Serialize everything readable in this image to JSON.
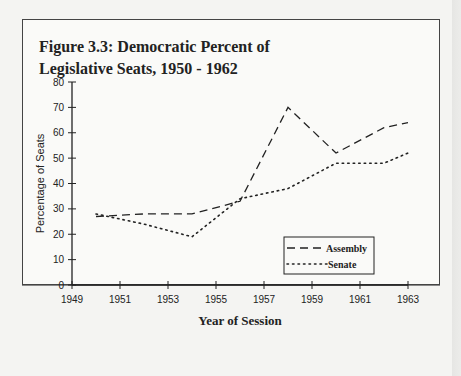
{
  "figure": {
    "title_line1": "Figure 3.3: Democratic Percent of",
    "title_line2": "Legislative Seats, 1950 - 1962"
  },
  "chart_data": {
    "type": "line",
    "title": "Figure 3.3: Democratic Percent of Legislative Seats, 1950 - 1962",
    "xlabel": "Year of Session",
    "ylabel": "Percentage of Seats",
    "xlim": [
      1949,
      1963
    ],
    "ylim": [
      0,
      80
    ],
    "x_ticks": [
      1949,
      1951,
      1953,
      1955,
      1957,
      1959,
      1961,
      1963
    ],
    "y_ticks": [
      0,
      10,
      20,
      30,
      40,
      50,
      60,
      70,
      80
    ],
    "grid": false,
    "legend_position": "lower right, inside plot",
    "series": [
      {
        "name": "Assembly",
        "style": "dashed",
        "x": [
          1950,
          1952,
          1954,
          1956,
          1958,
          1960,
          1962,
          1963
        ],
        "values": [
          27,
          28,
          28,
          33,
          70,
          52,
          62,
          64
        ]
      },
      {
        "name": "Senate",
        "style": "dotted",
        "x": [
          1950,
          1952,
          1954,
          1956,
          1958,
          1960,
          1962,
          1963
        ],
        "values": [
          28,
          24,
          19,
          34,
          38,
          48,
          48,
          52
        ]
      }
    ]
  },
  "legend": {
    "assembly": "Assembly",
    "senate": "Senate"
  }
}
